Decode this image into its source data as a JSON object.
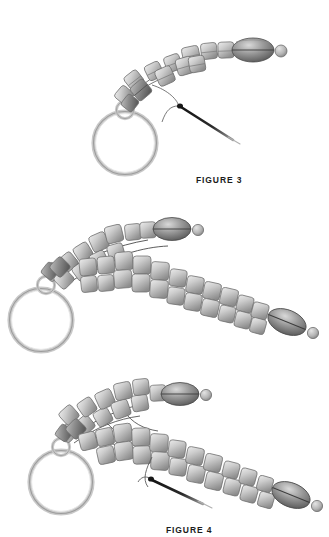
{
  "document": {
    "type": "beading-instruction-diagram",
    "background_color": "#ffffff",
    "width": 329,
    "height": 537
  },
  "palette": {
    "bead_light": "#e2e2e2",
    "bead_mid": "#b9b9b9",
    "bead_dark": "#8f8f8f",
    "bead_outline": "#6f6f6f",
    "oval_light": "#cfcfcf",
    "oval_dark": "#5a5a5a",
    "ring_light": "#dcdcdc",
    "ring_dark": "#a9a9a9",
    "thread": "#5c5c5c",
    "needle": "#111111",
    "caption_text": "#1c1c1c",
    "highlight_bead": "#6e6e6e"
  },
  "figures": [
    {
      "id": "figure-3",
      "caption": "FIGURE 3",
      "description": "Single row of cube beads curving up to an oval clasp bead, with split ring and needle starting a second pass.",
      "components": {
        "cube_beads_upper_row": 7,
        "cube_beads_lower_row": 4,
        "oval_clasp_beads": 1,
        "small_round_beads": 1,
        "large_ring": 1,
        "jump_ring": 1,
        "needle": 1,
        "thread_paths": 1,
        "highlighted_beads": 1
      }
    },
    {
      "id": "figure-4",
      "caption": "FIGURE 4",
      "description": "First beaded strand above, second longer strand of cube beads being added below, ending in a second oval clasp bead.",
      "components": {
        "cube_beads_upper_row": 11,
        "cube_beads_lower_row": 22,
        "oval_clasp_beads": 2,
        "small_round_beads": 2,
        "large_ring": 1,
        "jump_ring": 1,
        "needle": 0,
        "thread_paths": 2,
        "highlighted_beads": 1
      }
    },
    {
      "id": "figure-5",
      "caption": "FIGURE 5",
      "description": "Both strands complete and joined by thread, needle passing up through the lower strand to stitch the rows together.",
      "components": {
        "cube_beads_upper_row": 11,
        "cube_beads_lower_row": 21,
        "oval_clasp_beads": 2,
        "small_round_beads": 2,
        "large_ring": 1,
        "jump_ring": 1,
        "needle": 1,
        "thread_paths": 3,
        "highlighted_beads": 1
      }
    }
  ]
}
